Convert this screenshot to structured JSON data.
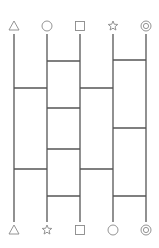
{
  "diagram": {
    "type": "amidakuji-ladder",
    "line_color": "#555555",
    "symbol_color": "#888888",
    "columns_x": [
      14,
      47,
      80,
      113,
      146
    ],
    "line_top_y": 34,
    "line_bottom_y": 222,
    "top_symbol_y": 26,
    "bottom_symbol_y": 230,
    "top_symbols": [
      "triangle",
      "circle",
      "square",
      "star",
      "double-circle"
    ],
    "bottom_symbols": [
      "triangle",
      "star",
      "square",
      "circle",
      "double-circle"
    ],
    "rungs": [
      {
        "from": 1,
        "to": 2,
        "y": 61
      },
      {
        "from": 3,
        "to": 4,
        "y": 60
      },
      {
        "from": 0,
        "to": 1,
        "y": 88
      },
      {
        "from": 2,
        "to": 3,
        "y": 88
      },
      {
        "from": 1,
        "to": 2,
        "y": 108
      },
      {
        "from": 3,
        "to": 4,
        "y": 128
      },
      {
        "from": 1,
        "to": 2,
        "y": 149
      },
      {
        "from": 0,
        "to": 1,
        "y": 169
      },
      {
        "from": 2,
        "to": 3,
        "y": 169
      },
      {
        "from": 1,
        "to": 2,
        "y": 196
      },
      {
        "from": 3,
        "to": 4,
        "y": 196
      }
    ]
  }
}
